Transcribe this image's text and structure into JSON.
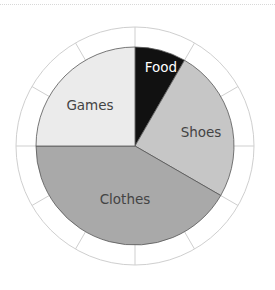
{
  "chart_data": {
    "type": "pie",
    "title": "",
    "categories": [
      "Food",
      "Shoes",
      "Clothes",
      "Games"
    ],
    "values": [
      1,
      3,
      5,
      3
    ],
    "percentages": [
      8.3,
      25.0,
      41.7,
      25.0
    ],
    "start_angle_deg": 0,
    "direction": "clockwise",
    "colors": [
      "#111111",
      "#c6c6c6",
      "#a9a9a9",
      "#ebebeb"
    ],
    "label_colors": [
      "#ffffff",
      "#444444",
      "#444444",
      "#444444"
    ],
    "outer_ring_segments": 12,
    "legend": "none",
    "labels_inside": true
  },
  "labels": {
    "food": "Food",
    "shoes": "Shoes",
    "clothes": "Clothes",
    "games": "Games"
  }
}
